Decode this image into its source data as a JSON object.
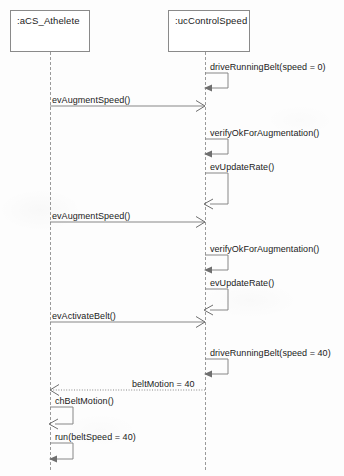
{
  "diagram": {
    "type": "uml-sequence-diagram",
    "width": 344,
    "height": 476,
    "background_color": "#fdfdfd",
    "line_color": "#878787",
    "text_color": "#1b1b1b"
  },
  "lifelines": [
    {
      "id": "athlete",
      "label": ":aCS_Athelete",
      "box": {
        "x": 10,
        "y": 10,
        "width": 80,
        "height": 42
      },
      "axis_x": 50,
      "line_bottom": 470
    },
    {
      "id": "control_speed",
      "label": ":ucControlSpeed",
      "box": {
        "x": 168,
        "y": 10,
        "width": 82,
        "height": 42
      },
      "axis_x": 205,
      "line_bottom": 470
    }
  ],
  "messages": [
    {
      "index": 1,
      "label": "driveRunningBelt(speed = 0)",
      "kind": "self-call",
      "lifeline": "control_speed",
      "direction": "self",
      "arrowhead": "filled",
      "line_style": "solid",
      "label_x": 210,
      "label_y": 62,
      "top_y": 73,
      "bottom_y": 88,
      "extent_x": 228
    },
    {
      "index": 2,
      "label": "evAugmentSpeed()",
      "kind": "call",
      "from": "athlete",
      "to": "control_speed",
      "direction": "left-to-right",
      "arrowhead": "open",
      "line_style": "solid",
      "label_x": 52,
      "label_y": 95,
      "line_y": 106
    },
    {
      "index": 3,
      "label": "verifyOkForAugmentation()",
      "kind": "self-call",
      "lifeline": "control_speed",
      "direction": "self",
      "arrowhead": "filled",
      "line_style": "solid",
      "label_x": 210,
      "label_y": 128,
      "top_y": 139,
      "bottom_y": 154,
      "extent_x": 228
    },
    {
      "index": 4,
      "label": "evUpdateRate()",
      "kind": "self-call",
      "lifeline": "control_speed",
      "direction": "self",
      "arrowhead": "open",
      "line_style": "solid",
      "label_x": 210,
      "label_y": 162,
      "top_y": 173,
      "bottom_y": 204,
      "extent_x": 228
    },
    {
      "index": 5,
      "label": "evAugmentSpeed()",
      "kind": "call",
      "from": "athlete",
      "to": "control_speed",
      "direction": "left-to-right",
      "arrowhead": "open",
      "line_style": "solid",
      "label_x": 52,
      "label_y": 211,
      "line_y": 222
    },
    {
      "index": 6,
      "label": "verifyOkForAugmentation()",
      "kind": "self-call",
      "lifeline": "control_speed",
      "direction": "self",
      "arrowhead": "filled",
      "line_style": "solid",
      "label_x": 210,
      "label_y": 244,
      "top_y": 255,
      "bottom_y": 270,
      "extent_x": 228
    },
    {
      "index": 7,
      "label": "evUpdateRate()",
      "kind": "self-call",
      "lifeline": "control_speed",
      "direction": "self",
      "arrowhead": "open",
      "line_style": "solid",
      "label_x": 210,
      "label_y": 278,
      "top_y": 289,
      "bottom_y": 310,
      "extent_x": 228
    },
    {
      "index": 8,
      "label": "evActivateBelt()",
      "kind": "call",
      "from": "athlete",
      "to": "control_speed",
      "direction": "left-to-right",
      "arrowhead": "open",
      "line_style": "solid",
      "label_x": 52,
      "label_y": 311,
      "line_y": 322
    },
    {
      "index": 9,
      "label": "driveRunningBelt(speed = 40)",
      "kind": "self-call",
      "lifeline": "control_speed",
      "direction": "self",
      "arrowhead": "filled",
      "line_style": "solid",
      "label_x": 210,
      "label_y": 348,
      "top_y": 359,
      "bottom_y": 374,
      "extent_x": 228
    },
    {
      "index": 10,
      "label": "beltMotion = 40",
      "kind": "return",
      "from": "control_speed",
      "to": "athlete",
      "direction": "right-to-left",
      "arrowhead": "open",
      "line_style": "dotted",
      "label_x": 195,
      "label_y": 379,
      "line_y": 390
    },
    {
      "index": 11,
      "label": "chBeltMotion()",
      "kind": "self-call",
      "lifeline": "athlete",
      "direction": "self",
      "arrowhead": "open",
      "line_style": "solid",
      "label_x": 55,
      "label_y": 396,
      "top_y": 407,
      "bottom_y": 424,
      "extent_x": 73
    },
    {
      "index": 12,
      "label": "run(beltSpeed = 40)",
      "kind": "self-call",
      "lifeline": "athlete",
      "direction": "self",
      "arrowhead": "filled",
      "line_style": "solid",
      "label_x": 55,
      "label_y": 432,
      "top_y": 443,
      "bottom_y": 459,
      "extent_x": 73
    }
  ]
}
